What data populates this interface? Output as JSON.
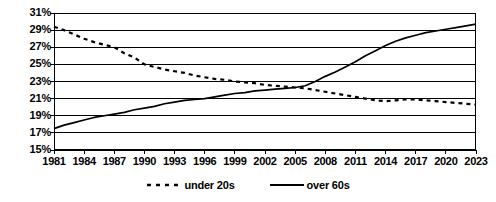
{
  "chart_data": {
    "type": "line",
    "title": "",
    "subtitle": "",
    "xlabel": "",
    "ylabel": "",
    "grid": true,
    "legend_position": "bottom",
    "xlim": [
      1981,
      2023
    ],
    "ylim": [
      15,
      31
    ],
    "ytick_step": 2,
    "ytick_labels": [
      "15%",
      "17%",
      "19%",
      "21%",
      "23%",
      "25%",
      "27%",
      "29%",
      "31%"
    ],
    "ytick_values": [
      15,
      17,
      19,
      21,
      23,
      25,
      27,
      29,
      31
    ],
    "xtick_labels": [
      "1981",
      "1984",
      "1987",
      "1990",
      "1993",
      "1996",
      "1999",
      "2002",
      "2005",
      "2008",
      "2011",
      "2014",
      "2017",
      "2020",
      "2023"
    ],
    "xtick_values": [
      1981,
      1984,
      1987,
      1990,
      1993,
      1996,
      1999,
      2002,
      2005,
      2008,
      2011,
      2014,
      2017,
      2020,
      2023
    ],
    "x": [
      1981,
      1982,
      1983,
      1984,
      1985,
      1986,
      1987,
      1988,
      1989,
      1990,
      1991,
      1992,
      1993,
      1994,
      1995,
      1996,
      1997,
      1998,
      1999,
      2000,
      2001,
      2002,
      2003,
      2004,
      2005,
      2006,
      2007,
      2008,
      2009,
      2010,
      2011,
      2012,
      2013,
      2014,
      2015,
      2016,
      2017,
      2018,
      2019,
      2020,
      2021,
      2022,
      2023
    ],
    "series": [
      {
        "name": "under 20s",
        "style": "dashed",
        "color": "#000000",
        "values": [
          29.4,
          29.0,
          28.5,
          28.0,
          27.6,
          27.3,
          27.0,
          26.3,
          25.8,
          25.0,
          24.7,
          24.4,
          24.2,
          24.0,
          23.7,
          23.5,
          23.3,
          23.2,
          23.0,
          22.9,
          22.8,
          22.6,
          22.5,
          22.4,
          22.3,
          22.2,
          22.0,
          21.8,
          21.6,
          21.4,
          21.2,
          21.0,
          20.8,
          20.7,
          20.8,
          20.9,
          20.9,
          20.8,
          20.7,
          20.6,
          20.5,
          20.4,
          20.3
        ]
      },
      {
        "name": "over 60s",
        "style": "solid",
        "color": "#000000",
        "values": [
          17.5,
          17.9,
          18.2,
          18.5,
          18.8,
          19.0,
          19.2,
          19.4,
          19.7,
          19.9,
          20.1,
          20.4,
          20.6,
          20.8,
          20.9,
          21.0,
          21.2,
          21.4,
          21.6,
          21.7,
          21.9,
          22.0,
          22.1,
          22.2,
          22.3,
          22.5,
          23.0,
          23.6,
          24.1,
          24.7,
          25.3,
          26.0,
          26.6,
          27.2,
          27.7,
          28.1,
          28.4,
          28.7,
          28.9,
          29.1,
          29.3,
          29.5,
          29.7
        ]
      }
    ],
    "legend": [
      {
        "label": "under 20s",
        "style": "dashed"
      },
      {
        "label": "over 60s",
        "style": "solid"
      }
    ]
  }
}
